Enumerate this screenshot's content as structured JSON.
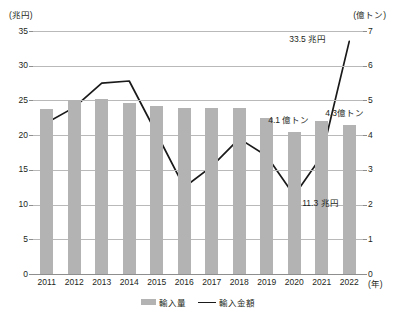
{
  "axes": {
    "left_unit": "(兆円)",
    "right_unit": "(億トン)",
    "x_unit": "(年)"
  },
  "legend": {
    "items": [
      {
        "label": "輸入量",
        "type": "bar",
        "color": "#b3b3b3"
      },
      {
        "label": "輸入金額",
        "type": "line",
        "color": "#1a1a1a"
      }
    ]
  },
  "annotations": [
    {
      "text": "33.5 兆円",
      "x_year": "2022",
      "value": 33.5,
      "unit": "兆円",
      "series": "輸入金額"
    },
    {
      "text": "4.1 億トン",
      "x_year": "2020",
      "value": 4.1,
      "unit": "億トン",
      "series": "輸入量"
    },
    {
      "text": "4.3億トン",
      "x_year": "2022",
      "value": 4.3,
      "unit": "億トン",
      "series": "輸入量"
    },
    {
      "text": "11.3 兆円",
      "x_year": "2020",
      "value": 11.3,
      "unit": "兆円",
      "series": "輸入金額"
    }
  ],
  "chart_data": {
    "type": "bar",
    "title": "",
    "xlabel": "(年)",
    "ylabel": "(兆円)",
    "y2label": "(億トン)",
    "grid": true,
    "legend_position": "bottom",
    "categories": [
      "2011",
      "2012",
      "2013",
      "2014",
      "2015",
      "2016",
      "2017",
      "2018",
      "2019",
      "2020",
      "2021",
      "2022"
    ],
    "ylim": [
      0,
      35
    ],
    "yticks": [
      0,
      5,
      10,
      15,
      20,
      25,
      30,
      35
    ],
    "y2lim": [
      0,
      7
    ],
    "y2ticks": [
      0,
      1,
      2,
      3,
      4,
      5,
      6,
      7
    ],
    "series": [
      {
        "name": "輸入量",
        "type": "bar",
        "axis": "right",
        "unit": "億トン",
        "color": "#b3b3b3",
        "values": [
          4.75,
          5.02,
          5.05,
          4.93,
          4.85,
          4.78,
          4.78,
          4.77,
          4.5,
          4.1,
          4.4,
          4.3
        ]
      },
      {
        "name": "輸入金額",
        "type": "line",
        "axis": "left",
        "unit": "兆円",
        "color": "#1a1a1a",
        "values": [
          21.8,
          24.0,
          27.5,
          27.8,
          20.2,
          12.5,
          15.5,
          19.5,
          17.0,
          11.3,
          17.0,
          33.5
        ]
      }
    ]
  }
}
